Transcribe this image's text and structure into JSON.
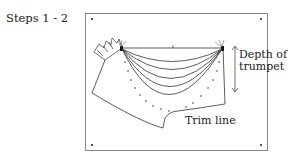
{
  "figure": {
    "step_label": "Steps 1 - 2",
    "annotations": {
      "depth_line1": "Depth of",
      "depth_line2": "trumpet",
      "trim": "Trim line"
    },
    "colors": {
      "line": "#333333",
      "frame": "#666666",
      "background": "#ffffff"
    }
  }
}
